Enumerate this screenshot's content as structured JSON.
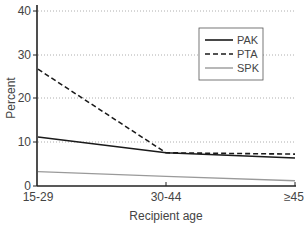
{
  "chart_data": {
    "type": "line",
    "title": "",
    "xlabel": "Recipient age",
    "ylabel": "Percent",
    "categories": [
      "15-29",
      "30-44",
      "≥45"
    ],
    "ylim": [
      0,
      40
    ],
    "yticks": [
      0,
      10,
      20,
      30,
      40
    ],
    "grid": "horizontal dotted",
    "legend_position": "upper right",
    "series": [
      {
        "name": "PAK",
        "style": "solid",
        "color": "#1a1a1a",
        "values": [
          11.2,
          7.6,
          6.4
        ]
      },
      {
        "name": "PTA",
        "style": "dashed",
        "color": "#1a1a1a",
        "values": [
          26.7,
          7.6,
          7.3
        ]
      },
      {
        "name": "SPK",
        "style": "solid",
        "color": "#9a9a9a",
        "values": [
          3.3,
          2.2,
          1.2
        ]
      }
    ]
  },
  "labels": {
    "ytick_0": "0",
    "ytick_10": "10",
    "ytick_20": "20",
    "ytick_30": "30",
    "ytick_40": "40",
    "xtick_0": "15-29",
    "xtick_1": "30-44",
    "xtick_2": "≥45",
    "xlabel": "Recipient age",
    "ylabel": "Percent",
    "legend_0": "PAK",
    "legend_1": "PTA",
    "legend_2": "SPK"
  }
}
